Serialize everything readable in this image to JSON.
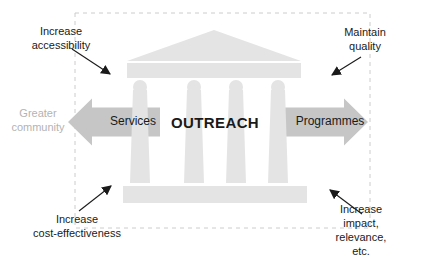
{
  "diagram": {
    "center_label": "OUTREACH",
    "arrows": {
      "left_label": "Services",
      "right_label": "Programmes"
    },
    "annotations": {
      "top_left": "Increase\naccessibility",
      "top_right": "Maintain quality",
      "left_outside": "Greater\ncommunity",
      "bottom_left": "Increase\ncost-effectiveness",
      "bottom_right": "Increase impact,\nrelevance, etc."
    },
    "colors": {
      "temple": "#e4e4e4",
      "arrow": "#c6c6c6",
      "dashed_border": "#cccccc",
      "text": "#1a1a1a",
      "muted_text": "#b3b3b3",
      "background": "#ffffff"
    }
  }
}
